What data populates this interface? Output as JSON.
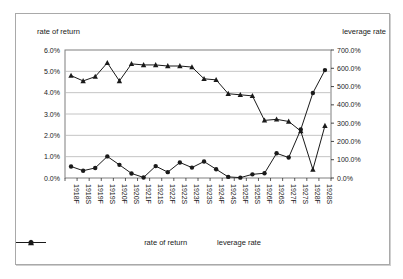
{
  "chart": {
    "left_axis_title": "rate of return",
    "right_axis_title": "leverage rate"
  },
  "colors": {
    "line": "#1a1a1a",
    "text": "#1a1a1a",
    "grid": "#b5b5b5",
    "plot_border": "#7f7f7f",
    "frame_border": "#a9a9a9"
  },
  "chart_data": {
    "type": "line",
    "grid": true,
    "legend_position": "bottom",
    "categories": [
      "1918F",
      "1918S",
      "1919F",
      "1919S",
      "1920F",
      "1920S",
      "1921F",
      "1921S",
      "1922F",
      "1922S",
      "1923F",
      "1923S",
      "1924F",
      "1924S",
      "1925F",
      "1925S",
      "1926F",
      "1926S",
      "1927F",
      "1927S",
      "1928F",
      "1928S"
    ],
    "left_axis": {
      "title": "rate of return",
      "min": 0,
      "max": 6,
      "major": 1,
      "unit": "%",
      "ticks": [
        "6.0%",
        "5.0%",
        "4.0%",
        "3.0%",
        "2.0%",
        "1.0%",
        "0.0%"
      ]
    },
    "right_axis": {
      "title": "leverage rate",
      "min": 0,
      "max": 700,
      "major": 100,
      "unit": "%",
      "ticks": [
        "700.0%",
        "600.0%",
        "500.0%",
        "400.0%",
        "300.0%",
        "200.0%",
        "100.0%",
        "0.0%"
      ]
    },
    "series": [
      {
        "name": "rate of return",
        "axis": "left",
        "marker": "triangle",
        "values": [
          4.8,
          4.55,
          4.75,
          5.4,
          4.55,
          5.35,
          5.3,
          5.3,
          5.25,
          5.25,
          5.2,
          4.65,
          4.6,
          3.95,
          3.9,
          3.85,
          2.7,
          2.75,
          2.65,
          2.2,
          0.4,
          2.45
        ]
      },
      {
        "name": "leverage rate",
        "axis": "right",
        "marker": "circle",
        "values": [
          63,
          40,
          55,
          118,
          72,
          25,
          3,
          65,
          32,
          85,
          57,
          90,
          48,
          6,
          2,
          20,
          26,
          135,
          112,
          265,
          465,
          590
        ]
      }
    ]
  }
}
